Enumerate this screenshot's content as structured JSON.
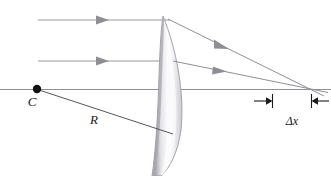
{
  "figure": {
    "type": "optical-ray-diagram",
    "width": 331,
    "height": 176,
    "background_color": "#ffffff"
  },
  "labels": {
    "center_of_curvature": "C",
    "radius": "R",
    "aberration": "Δx"
  },
  "colors": {
    "ray_line": "#8f8f97",
    "axis_line": "#8f8f97",
    "radius_line": "#5a5a62",
    "dimension_line": "#1a1a1a",
    "lens_outline": "#9a9aa2",
    "lens_fill_light": "#fdfdfd",
    "lens_fill_dark": "#b9b9bf",
    "point_fill": "#111111",
    "label_text": "#1a1a1a"
  },
  "geometry": {
    "optical_axis": {
      "y": 89,
      "x_start": 0,
      "x_end": 331
    },
    "center_point": {
      "x": 37,
      "y": 89,
      "radius": 4
    },
    "lens": {
      "apex_x": 178,
      "top_tip": {
        "x": 163,
        "y": 16
      },
      "bottom_tip": {
        "x": 155,
        "y": 176
      },
      "front_surface_x": 160,
      "widest_x": 181
    },
    "incident_rays": [
      {
        "id": "marginal-ray",
        "y": 20,
        "x_start": 38,
        "x_end": 168,
        "arrow_x": 103
      },
      {
        "id": "paraxial-ray",
        "y": 61,
        "x_start": 38,
        "x_end": 172,
        "arrow_x": 103
      }
    ],
    "refracted_rays": [
      {
        "id": "marginal-refracted",
        "x1": 168,
        "y1": 20,
        "x2": 320,
        "y2": 95,
        "arrow_x": 228,
        "arrow_y": 50,
        "axis_crossing_x": 272
      },
      {
        "id": "paraxial-refracted",
        "x1": 172,
        "y1": 61,
        "x2": 326,
        "y2": 92,
        "arrow_x": 228,
        "arrow_y": 72,
        "axis_crossing_x": 311
      }
    ],
    "radius_line": {
      "x1": 39,
      "y1": 90,
      "x2": 172,
      "y2": 134
    },
    "dimension": {
      "y": 101,
      "left_tick_x": 272,
      "right_tick_x": 311,
      "left_arrow_start_x": 254,
      "right_arrow_start_x": 329,
      "tick_half_height": 7
    },
    "label_positions": {
      "center_of_curvature": {
        "x": 34,
        "y": 105
      },
      "radius": {
        "x": 94,
        "y": 122
      },
      "aberration": {
        "x": 291,
        "y": 124
      }
    }
  }
}
